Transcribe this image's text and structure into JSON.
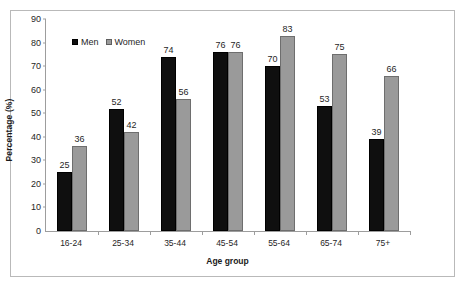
{
  "chart_data": {
    "type": "bar",
    "title": "",
    "subtitle": "",
    "xlabel": "Age group",
    "ylabel": "Percentage (%)",
    "categories": [
      "16-24",
      "25-34",
      "35-44",
      "45-54",
      "55-64",
      "65-74",
      "75+"
    ],
    "series": [
      {
        "name": "Men",
        "color": "#0f0f0f",
        "values": [
          25,
          52,
          74,
          76,
          70,
          53,
          39
        ]
      },
      {
        "name": "Women",
        "color": "#9a9a9a",
        "values": [
          36,
          42,
          56,
          76,
          83,
          75,
          66
        ]
      }
    ],
    "ylim": [
      0,
      90
    ],
    "ytick_step": 10,
    "yticks": [
      0,
      10,
      20,
      30,
      40,
      50,
      60,
      70,
      80,
      90
    ],
    "grid": false,
    "legend_position": "upper-left-inside",
    "data_labels": true
  },
  "legend": {
    "men_label": "Men",
    "women_label": "Women"
  },
  "axes": {
    "y_title": "Percentage (%)",
    "x_title": "Age group"
  }
}
